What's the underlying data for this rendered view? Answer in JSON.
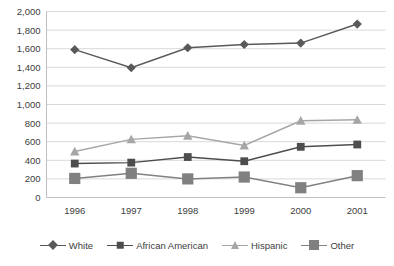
{
  "chart_data": {
    "type": "line",
    "title": "",
    "subtitle": "",
    "xlabel": "",
    "ylabel": "",
    "categories": [
      "1996",
      "1997",
      "1998",
      "1999",
      "2000",
      "2001"
    ],
    "ylim": [
      0,
      2000
    ],
    "ytick_step": 200,
    "yticks": [
      "0",
      "200",
      "400",
      "600",
      "800",
      "1,000",
      "1,200",
      "1,400",
      "1,600",
      "1,800",
      "2,000"
    ],
    "ytick_values": [
      0,
      200,
      400,
      600,
      800,
      1000,
      1200,
      1400,
      1600,
      1800,
      2000
    ],
    "grid": true,
    "grid_axis": "y",
    "legend_position": "bottom",
    "series": [
      {
        "name": "White",
        "marker": "diamond",
        "color": "#595959",
        "values": [
          1590,
          1395,
          1610,
          1645,
          1660,
          1865
        ]
      },
      {
        "name": "African American",
        "marker": "square-small",
        "color": "#4d4d4d",
        "values": [
          365,
          375,
          435,
          390,
          545,
          570
        ]
      },
      {
        "name": "Hispanic",
        "marker": "triangle",
        "color": "#a6a6a6",
        "values": [
          495,
          625,
          665,
          560,
          825,
          835
        ]
      },
      {
        "name": "Other",
        "marker": "square-large",
        "color": "#808080",
        "values": [
          205,
          260,
          200,
          220,
          105,
          235
        ]
      }
    ]
  },
  "axis": {
    "grid_color": "#d9d9d9",
    "axis_color": "#bfbfbf",
    "tick_text_color": "#3d3d3d"
  },
  "legend": {
    "items": [
      {
        "label": "White"
      },
      {
        "label": "African American"
      },
      {
        "label": "Hispanic"
      },
      {
        "label": "Other"
      }
    ]
  }
}
